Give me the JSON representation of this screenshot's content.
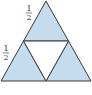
{
  "diagram": {
    "type": "sierpinski-triangle-step",
    "fill_color": "#c5dcef",
    "stroke_color": "#3a3a3a",
    "center_fill": "#ffffff",
    "labels": [
      {
        "num": "1",
        "den": "2",
        "position": "upper-left-edge"
      },
      {
        "num": "1",
        "den": "2",
        "position": "lower-left-edge"
      }
    ]
  }
}
